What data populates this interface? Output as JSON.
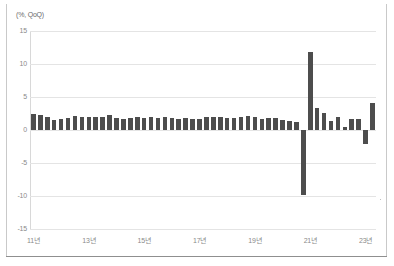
{
  "chart_data": {
    "type": "bar",
    "title": "",
    "subtitle": "",
    "unit_label": "(%, QoQ)",
    "xlabel": "",
    "ylabel": "",
    "ylim": [
      -15,
      15
    ],
    "yticks": [
      15,
      10,
      5,
      0,
      -5,
      -10,
      -15
    ],
    "ytick_labels": [
      "15",
      "10",
      "5",
      "0",
      "-5",
      "-10",
      "-15"
    ],
    "grid": true,
    "legend": null,
    "bar_color": "#4d4d4d",
    "grid_color": "#e4e4e4",
    "x_axis_note": "Quarterly data, labelled every 2 years in Korean year format",
    "xtick_labels": [
      "11년",
      "13년",
      "15년",
      "17년",
      "19년",
      "21년",
      "23년"
    ],
    "xtick_categories": [
      "2011Q1",
      "2013Q1",
      "2015Q1",
      "2017Q1",
      "2019Q1",
      "2021Q1",
      "2023Q1"
    ],
    "categories": [
      "2011Q1",
      "2011Q2",
      "2011Q3",
      "2011Q4",
      "2012Q1",
      "2012Q2",
      "2012Q3",
      "2012Q4",
      "2013Q1",
      "2013Q2",
      "2013Q3",
      "2013Q4",
      "2014Q1",
      "2014Q2",
      "2014Q3",
      "2014Q4",
      "2015Q1",
      "2015Q2",
      "2015Q3",
      "2015Q4",
      "2016Q1",
      "2016Q2",
      "2016Q3",
      "2016Q4",
      "2017Q1",
      "2017Q2",
      "2017Q3",
      "2017Q4",
      "2018Q1",
      "2018Q2",
      "2018Q3",
      "2018Q4",
      "2019Q1",
      "2019Q2",
      "2019Q3",
      "2019Q4",
      "2020Q1",
      "2020Q2",
      "2020Q3",
      "2020Q4",
      "2021Q1",
      "2021Q2",
      "2021Q3",
      "2021Q4",
      "2022Q1",
      "2022Q2",
      "2022Q3",
      "2022Q4",
      "2023Q1",
      "2023Q2"
    ],
    "values": [
      2.5,
      2.2,
      2.0,
      1.5,
      1.6,
      1.8,
      2.1,
      1.9,
      2.0,
      1.9,
      2.0,
      2.2,
      1.8,
      1.7,
      1.8,
      1.9,
      1.8,
      1.9,
      1.8,
      1.9,
      1.8,
      1.7,
      1.8,
      1.7,
      1.7,
      2.0,
      1.9,
      1.9,
      1.8,
      1.8,
      1.9,
      2.1,
      1.9,
      1.7,
      1.8,
      1.8,
      1.5,
      1.3,
      1.2,
      -9.9,
      11.8,
      3.4,
      2.6,
      1.3,
      1.9,
      0.4,
      1.7,
      1.6,
      -2.1,
      4.1
    ]
  }
}
